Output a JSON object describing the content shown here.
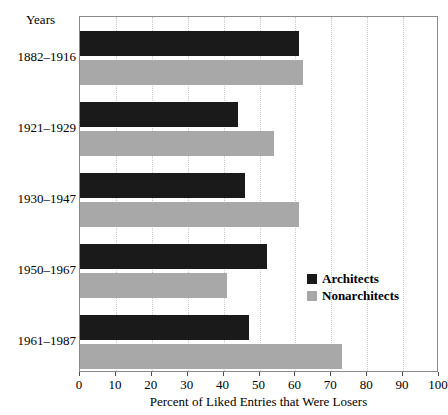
{
  "chart_data": {
    "type": "bar",
    "orientation": "horizontal",
    "title": "",
    "xlabel": "Percent of Liked Entries that Were Losers",
    "ylabel": "Years",
    "xlim": [
      0,
      100
    ],
    "xticks": [
      0,
      10,
      20,
      30,
      40,
      50,
      60,
      70,
      80,
      90,
      100
    ],
    "xtick_labels": [
      "0",
      "10",
      "20",
      "30",
      "40",
      "50",
      "60",
      "70",
      "80",
      "90",
      "100"
    ],
    "grid": true,
    "grid_axis": "x",
    "legend_position": "center-right-inside",
    "categories": [
      "1882–1916",
      "1921–1929",
      "1930–1947",
      "1950–1967",
      "1961–1987"
    ],
    "series": [
      {
        "name": "Architects",
        "color": "#1a1a1a",
        "values": [
          61,
          44,
          46,
          52,
          47
        ]
      },
      {
        "name": "Nonarchitects",
        "color": "#a8a8a8",
        "values": [
          62,
          54,
          61,
          41,
          73
        ]
      }
    ]
  },
  "axis": {
    "years_label": "Years",
    "x_title": "Percent of Liked Entries that Were Losers",
    "category_labels": [
      "1882–1916",
      "1921–1929",
      "1930–1947",
      "1950–1967",
      "1961–1987"
    ],
    "x_tick_labels": [
      "0",
      "10",
      "20",
      "30",
      "40",
      "50",
      "60",
      "70",
      "80",
      "90",
      "100"
    ]
  },
  "legend": {
    "items": [
      {
        "label": "Architects",
        "color": "#1a1a1a"
      },
      {
        "label": "Nonarchitects",
        "color": "#a8a8a8"
      }
    ]
  },
  "colors": {
    "architects": "#1a1a1a",
    "nonarchitects": "#a8a8a8",
    "frame": "#8a8a8a",
    "grid": "#c9c9c9",
    "background": "#ffffff"
  }
}
